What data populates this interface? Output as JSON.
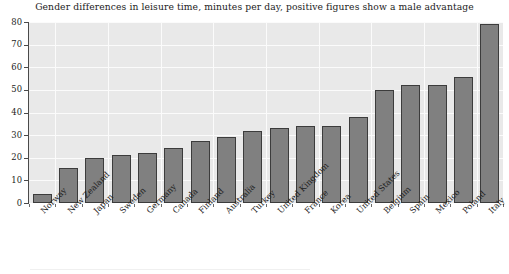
{
  "chart_data": {
    "type": "bar",
    "title": "Gender differences in leisure time, minutes per day, positive figures show a male advantage",
    "xlabel": "",
    "ylabel": "",
    "ylim": [
      0,
      80
    ],
    "yticks": [
      0,
      10,
      20,
      30,
      40,
      50,
      60,
      70,
      80
    ],
    "ytick_labels": [
      "0",
      "10",
      "20",
      "30",
      "40",
      "50",
      "60",
      "70",
      "80"
    ],
    "grid": true,
    "legend": "none",
    "categories": [
      "Norway",
      "New Zealand",
      "Japan",
      "Sweden",
      "Germany",
      "Canada",
      "Finland",
      "Australia",
      "Turkey",
      "United Kingdom",
      "France",
      "Korea",
      "United States",
      "Belgium",
      "Spain",
      "Mexico",
      "Poland",
      "Italy"
    ],
    "values": [
      4,
      15.5,
      20,
      21,
      22,
      24.5,
      27.5,
      29,
      32,
      33,
      34,
      34,
      38,
      50,
      52,
      52,
      55.5,
      79
    ],
    "series": [
      {
        "name": "Gender difference in leisure time (minutes per day)",
        "values": [
          4,
          15.5,
          20,
          21,
          22,
          24.5,
          27.5,
          29,
          32,
          33,
          34,
          34,
          38,
          50,
          52,
          52,
          55.5,
          79
        ]
      }
    ]
  },
  "style": {
    "bar_fill": "#808080",
    "bar_edge": "#3c3c3c",
    "plot_background": "#e9e9e9",
    "grid_color": "#fbfbfb",
    "axis_color": "#4a4a4a",
    "text_color": "#1c1c1c",
    "page_background": "#ffffff"
  }
}
